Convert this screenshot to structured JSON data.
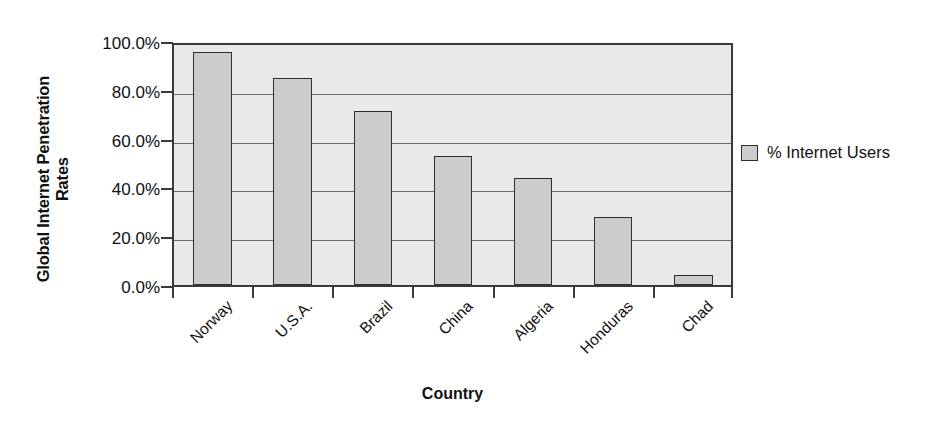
{
  "chart_data": {
    "type": "bar",
    "title": "",
    "categories": [
      "Norway",
      "U.S.A.",
      "Brazil",
      "China",
      "Algeria",
      "Honduras",
      "Chad"
    ],
    "values": [
      95.5,
      84.7,
      71.2,
      52.8,
      44.0,
      27.8,
      3.9
    ],
    "series": [
      {
        "name": "% Internet Users",
        "values": [
          95.5,
          84.7,
          71.2,
          52.8,
          44.0,
          27.8,
          3.9
        ]
      }
    ],
    "xlabel": "Country",
    "ylabel": "Global Internet Penetration Rates",
    "ylim": [
      0,
      100
    ],
    "ytick_values": [
      0,
      20,
      40,
      60,
      80,
      100
    ],
    "ytick_labels": [
      "0.0%",
      "20.0%",
      "40.0%",
      "60.0%",
      "80.0%",
      "100.0%"
    ],
    "grid": true,
    "legend_position": "right",
    "legend_entries": [
      "% Internet Users"
    ],
    "bar_color": "#cccccc",
    "bar_border_color": "#2e2e2e",
    "plot_background": "#e9e9e9",
    "gridline_color": "#6a6a6a",
    "xtick_label_rotation": -45
  },
  "axes": {
    "y_title_line1": "Global Internet Penetration",
    "y_title_line2": "Rates",
    "x_title": "Country"
  },
  "legend": {
    "swatch_name": "series-swatch",
    "label": "% Internet Users"
  }
}
